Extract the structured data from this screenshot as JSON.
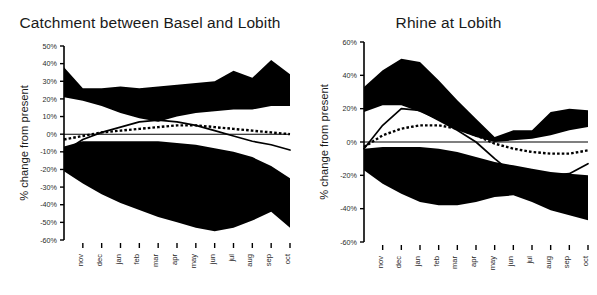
{
  "figure": {
    "background_color": "#ffffff",
    "ink_color": "#000000",
    "panel_count": 2
  },
  "chart_data": [
    {
      "type": "area",
      "panel": "left",
      "title": "Catchment between Basel and Lobith",
      "xlabel": "",
      "ylabel": "% change from present",
      "categories": [
        "nov",
        "dec",
        "jan",
        "feb",
        "mar",
        "apr",
        "may",
        "jun",
        "jul",
        "aug",
        "sep",
        "oct"
      ],
      "ytick_labels": [
        "50%",
        "40%",
        "30%",
        "20%",
        "10%",
        "0%",
        "-10%",
        "-20%",
        "-30%",
        "-40%",
        "-50%",
        "-60%"
      ],
      "ytick_values": [
        50,
        40,
        30,
        20,
        10,
        0,
        -10,
        -20,
        -30,
        -40,
        -50,
        -60
      ],
      "ylim": [
        -60,
        50
      ],
      "grid": false,
      "legend_position": "none",
      "series": [
        {
          "name": "upper band max",
          "kind": "band-upper",
          "values": [
            38,
            26,
            26,
            27,
            26,
            27,
            28,
            29,
            30,
            36,
            32,
            42,
            34
          ]
        },
        {
          "name": "upper band min",
          "kind": "band-lower",
          "values": [
            21,
            19,
            16,
            12,
            9,
            7,
            10,
            12,
            13,
            14,
            14,
            16,
            16
          ]
        },
        {
          "name": "lower band max",
          "kind": "band-upper",
          "values": [
            -7,
            -4,
            -4,
            -4,
            -4,
            -4,
            -5,
            -6,
            -8,
            -10,
            -13,
            -18,
            -25
          ]
        },
        {
          "name": "lower band min",
          "kind": "band-lower",
          "values": [
            -21,
            -28,
            -34,
            -39,
            -43,
            -47,
            -50,
            -53,
            -55,
            -53,
            -49,
            -44,
            -53
          ]
        },
        {
          "name": "solid line",
          "kind": "line-solid",
          "values": [
            -10,
            -3,
            1,
            4,
            7,
            8,
            7,
            5,
            2,
            -1,
            -4,
            -6,
            -9
          ]
        },
        {
          "name": "dotted line",
          "kind": "line-dotted",
          "values": [
            -3,
            -1,
            1,
            2,
            3,
            4,
            5,
            5,
            4,
            3,
            2,
            1,
            0
          ]
        }
      ]
    },
    {
      "type": "area",
      "panel": "right",
      "title": "Rhine at Lobith",
      "xlabel": "",
      "ylabel": "% change from present",
      "categories": [
        "nov",
        "dec",
        "jan",
        "feb",
        "mar",
        "apr",
        "may",
        "jun",
        "jul",
        "aug",
        "sep",
        "oct"
      ],
      "ytick_labels": [
        "60%",
        "40%",
        "20%",
        "0%",
        "-20%",
        "-40%",
        "-60%"
      ],
      "ytick_values": [
        60,
        40,
        20,
        0,
        -20,
        -40,
        -60
      ],
      "ylim": [
        -60,
        60
      ],
      "grid": false,
      "legend_position": "none",
      "series": [
        {
          "name": "upper band max",
          "kind": "band-upper",
          "values": [
            33,
            43,
            50,
            48,
            37,
            25,
            14,
            3,
            7,
            7,
            18,
            20,
            19
          ]
        },
        {
          "name": "upper band min",
          "kind": "band-lower",
          "values": [
            18,
            22,
            22,
            18,
            13,
            7,
            3,
            0,
            1,
            2,
            4,
            7,
            9
          ]
        },
        {
          "name": "lower band max",
          "kind": "band-upper",
          "values": [
            -4,
            -3,
            -3,
            -3,
            -4,
            -6,
            -9,
            -12,
            -14,
            -16,
            -18,
            -19,
            -20
          ]
        },
        {
          "name": "lower band min",
          "kind": "band-lower",
          "values": [
            -17,
            -25,
            -31,
            -36,
            -38,
            -38,
            -36,
            -33,
            -32,
            -36,
            -41,
            -44,
            -47
          ]
        },
        {
          "name": "solid line",
          "kind": "line-solid",
          "values": [
            -4,
            10,
            20,
            19,
            13,
            7,
            0,
            -10,
            -19,
            -20,
            -20,
            -19,
            -13
          ]
        },
        {
          "name": "dotted line",
          "kind": "line-dotted",
          "values": [
            -3,
            4,
            8,
            10,
            10,
            8,
            4,
            -1,
            -4,
            -6,
            -7,
            -7,
            -5
          ]
        }
      ]
    }
  ]
}
